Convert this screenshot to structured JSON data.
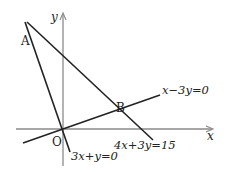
{
  "diagram": {
    "axes": {
      "x_label": "x",
      "y_label": "y",
      "origin_label": "O"
    },
    "points": [
      {
        "label": "A",
        "description": "intersection of 3x+y=0 and 4x+3y=15"
      },
      {
        "label": "B",
        "description": "intersection of 4x+3y=15 and x−3y=0"
      }
    ],
    "lines": [
      {
        "equation": "x−3y=0"
      },
      {
        "equation": "4x+3y=15"
      },
      {
        "equation": "3x+y=0"
      }
    ],
    "colors": {
      "axis": "#8a8a8a",
      "line": "#222222"
    }
  }
}
